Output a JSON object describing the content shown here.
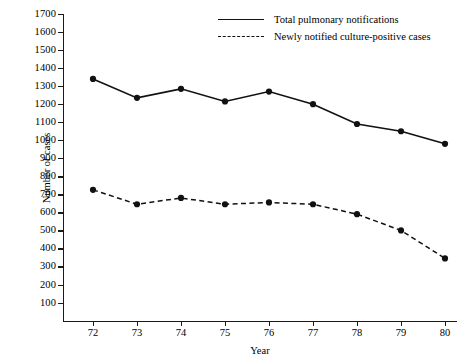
{
  "chart_data": {
    "type": "line",
    "title": "",
    "xlabel": "Year",
    "ylabel": "Number of cases",
    "x": [
      72,
      73,
      74,
      75,
      76,
      77,
      78,
      79,
      80
    ],
    "xtick_labels": [
      "72",
      "73",
      "74",
      "75",
      "76",
      "77",
      "78",
      "79",
      "80"
    ],
    "ylim": [
      0,
      1700
    ],
    "ytick_values": [
      100,
      200,
      300,
      400,
      500,
      600,
      700,
      800,
      900,
      1000,
      1100,
      1200,
      1300,
      1400,
      1500,
      1600,
      1700
    ],
    "ytick_labels": [
      "100",
      "200",
      "300",
      "400",
      "500",
      "600",
      "700",
      "800",
      "900",
      "1000",
      "1100",
      "1200",
      "1300",
      "1400",
      "1500",
      "1600",
      "1700"
    ],
    "grid": false,
    "legend_position": "top-right",
    "series": [
      {
        "name": "Total pulmonary notifications",
        "style": "solid",
        "color": "#111111",
        "marker": "filled-circle",
        "values": [
          1340,
          1235,
          1285,
          1215,
          1270,
          1200,
          1090,
          1050,
          980
        ]
      },
      {
        "name": "Newly notified culture-positive cases",
        "style": "dashed",
        "color": "#111111",
        "marker": "filled-circle",
        "values": [
          725,
          645,
          680,
          645,
          655,
          645,
          590,
          500,
          345
        ]
      }
    ]
  },
  "legend": {
    "items": [
      {
        "label": "Total pulmonary notifications",
        "style": "solid"
      },
      {
        "label": "Newly notified culture-positive cases",
        "style": "dashed"
      }
    ]
  },
  "axes": {
    "y_title": "Number of cases",
    "x_title": "Year"
  }
}
